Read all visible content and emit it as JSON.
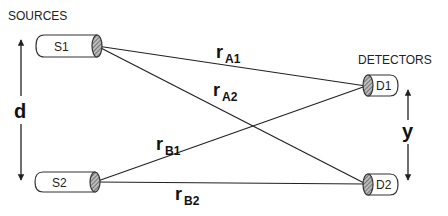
{
  "headings": {
    "sources": "SOURCES",
    "detectors": "DETECTORS"
  },
  "sources": [
    {
      "id": "S1",
      "label": "S1"
    },
    {
      "id": "S2",
      "label": "S2"
    }
  ],
  "detectors": [
    {
      "id": "D1",
      "label": "D1"
    },
    {
      "id": "D2",
      "label": "D2"
    }
  ],
  "paths": [
    {
      "id": "rA1",
      "main": "r",
      "sub": "A1",
      "from": "S1",
      "to": "D1"
    },
    {
      "id": "rA2",
      "main": "r",
      "sub": "A2",
      "from": "S1",
      "to": "D2"
    },
    {
      "id": "rB1",
      "main": "r",
      "sub": "B1",
      "from": "S2",
      "to": "D1"
    },
    {
      "id": "rB2",
      "main": "r",
      "sub": "B2",
      "from": "S2",
      "to": "D2"
    }
  ],
  "dimensions": {
    "source_separation": "d",
    "detector_separation": "y"
  },
  "colors": {
    "line": "#222222",
    "background": "#ffffff"
  }
}
